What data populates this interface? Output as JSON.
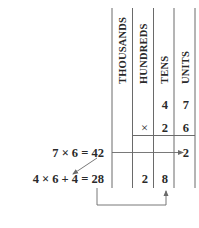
{
  "diagram": {
    "columns": [
      {
        "key": "thousands",
        "label": "THOUSANDS"
      },
      {
        "key": "hundreds",
        "label": "HUNDREDS"
      },
      {
        "key": "tens",
        "label": "TENS"
      },
      {
        "key": "units",
        "label": "UNITS"
      }
    ],
    "multiplicand": {
      "tens": "4",
      "units": "7"
    },
    "multiplier": {
      "operator": "×",
      "tens": "2",
      "units": "6"
    },
    "partial_row_1": {
      "units": "2"
    },
    "partial_row_2": {
      "hundreds": "2",
      "tens": "8"
    },
    "steps": [
      {
        "label": "7 × 6 = 42"
      },
      {
        "label": "4 × 6 + 4 = 28"
      }
    ],
    "colors": {
      "text": "#2a2a2a",
      "lines": "#6a6a6a",
      "background": "#ffffff"
    }
  }
}
